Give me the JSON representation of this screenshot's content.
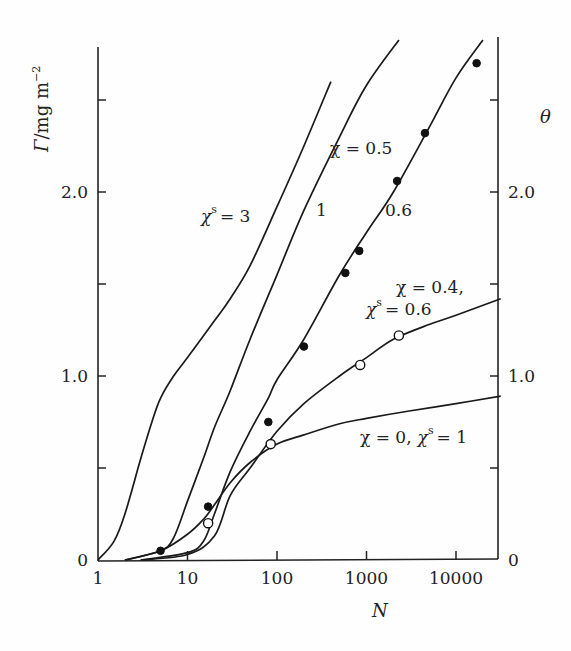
{
  "chart_data": {
    "type": "line",
    "title": "",
    "xlabel": "N",
    "ylabel": "Γ/mg m⁻²",
    "ylabel_right": "θ",
    "xscale": "log",
    "xlim": [
      1,
      31600
    ],
    "ylim": [
      0,
      2.78
    ],
    "x_ticks": [
      "1",
      "10",
      "100",
      "1000",
      "10000"
    ],
    "y_ticks_left": [
      "0",
      "1.0",
      "2.0"
    ],
    "y_ticks_right": [
      "0",
      "1.0",
      "2.0"
    ],
    "grid": false,
    "series": [
      {
        "name": "χs = 3",
        "label": "χ^s = 3",
        "x": [
          1,
          1.5,
          2,
          3,
          4,
          5,
          7,
          10,
          20,
          30,
          50,
          100,
          200,
          400
        ],
        "y": [
          0,
          0.1,
          0.25,
          0.55,
          0.75,
          0.88,
          1.0,
          1.1,
          1.3,
          1.42,
          1.6,
          1.92,
          2.25,
          2.6
        ]
      },
      {
        "name": "χ = 0.5, χs = 1",
        "label": "1",
        "x": [
          2,
          5,
          7,
          10,
          15,
          20,
          30,
          50,
          100,
          200,
          500,
          1000,
          2300
        ],
        "y": [
          0,
          0.05,
          0.12,
          0.32,
          0.55,
          0.72,
          0.92,
          1.2,
          1.55,
          1.9,
          2.3,
          2.58,
          2.92
        ]
      },
      {
        "name": "χ = 0.5, χs = 0.6",
        "label": "0.6",
        "x": [
          3,
          10,
          15,
          20,
          30,
          50,
          80,
          100,
          200,
          500,
          1000,
          2000,
          5000,
          10000,
          20000
        ],
        "y": [
          0,
          0.04,
          0.1,
          0.25,
          0.48,
          0.7,
          0.88,
          0.98,
          1.2,
          1.55,
          1.78,
          2.0,
          2.35,
          2.62,
          2.92
        ]
      },
      {
        "name": "χ = 0.4, χs = 0.6",
        "label": "χ = 0.4, χ^s = 0.6",
        "x": [
          3,
          10,
          20,
          30,
          50,
          100,
          200,
          500,
          1000,
          2000,
          5000,
          10000,
          31600
        ],
        "y": [
          0,
          0.03,
          0.13,
          0.35,
          0.5,
          0.7,
          0.85,
          1.0,
          1.1,
          1.2,
          1.28,
          1.33,
          1.42
        ]
      },
      {
        "name": "χ = 0, χs = 1",
        "label": "χ = 0, χ^s = 1",
        "x": [
          2,
          5,
          10,
          15,
          20,
          30,
          50,
          100,
          200,
          500,
          1000,
          3000,
          10000,
          31600
        ],
        "y": [
          0,
          0.05,
          0.14,
          0.22,
          0.3,
          0.42,
          0.53,
          0.63,
          0.68,
          0.74,
          0.77,
          0.81,
          0.85,
          0.89
        ]
      }
    ],
    "points": [
      {
        "name": "filled (experiment)",
        "marker": "filled-circle",
        "x": [
          5,
          17,
          80,
          200,
          580,
          830,
          2200,
          4500,
          17000
        ],
        "y": [
          0.05,
          0.29,
          0.75,
          1.16,
          1.56,
          1.68,
          2.06,
          2.32,
          2.7
        ]
      },
      {
        "name": "open (experiment)",
        "marker": "open-circle",
        "x": [
          17,
          85,
          850,
          2300
        ],
        "y": [
          0.2,
          0.63,
          1.06,
          1.22
        ]
      }
    ]
  },
  "labels": {
    "y_left_title_main": "Γ",
    "y_left_title_unit": "/mg m",
    "y_left_title_exp": "−2",
    "y_right_title": "θ",
    "x_title": "N",
    "ann_chis3_chi": "χ",
    "ann_chis3_sup": "s",
    "ann_chis3_val": "= 3",
    "ann_chi05": "χ = 0.5",
    "ann_one": "1",
    "ann_06": "0.6",
    "ann_chi04_line1": "χ = 0.4,",
    "ann_chi04_chi": "χ",
    "ann_chi04_sup": "s",
    "ann_chi04_val": "= 0.6",
    "ann_chi0_a": "χ = 0,",
    "ann_chi0_chi": "χ",
    "ann_chi0_sup": "s",
    "ann_chi0_val": "= 1"
  }
}
